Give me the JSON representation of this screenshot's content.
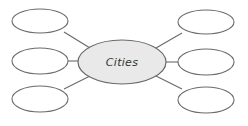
{
  "diagram": {
    "type": "spider-map",
    "center": {
      "label": "Cities",
      "fill": "#e9e9e9",
      "cx": 122,
      "cy": 62,
      "rx": 44,
      "ry": 22
    },
    "stroke_color": "#6a6a6a",
    "branches": [
      {
        "id": "left-top",
        "label": "",
        "cx": 40,
        "cy": 21,
        "rx": 28,
        "ry": 12,
        "line": [
          64,
          32,
          90,
          48
        ]
      },
      {
        "id": "left-middle",
        "label": "",
        "cx": 40,
        "cy": 61,
        "rx": 28,
        "ry": 13,
        "line": [
          68,
          61,
          78,
          61
        ]
      },
      {
        "id": "left-bottom",
        "label": "",
        "cx": 40,
        "cy": 99,
        "rx": 28,
        "ry": 13,
        "line": [
          64,
          89,
          90,
          76
        ]
      },
      {
        "id": "right-top",
        "label": "",
        "cx": 206,
        "cy": 22,
        "rx": 28,
        "ry": 12,
        "line": [
          182,
          33,
          156,
          48
        ]
      },
      {
        "id": "right-middle",
        "label": "",
        "cx": 206,
        "cy": 62,
        "rx": 28,
        "ry": 13,
        "line": [
          166,
          62,
          178,
          62
        ]
      },
      {
        "id": "right-bottom",
        "label": "",
        "cx": 206,
        "cy": 100,
        "rx": 28,
        "ry": 13,
        "line": [
          182,
          89,
          156,
          76
        ]
      }
    ]
  }
}
